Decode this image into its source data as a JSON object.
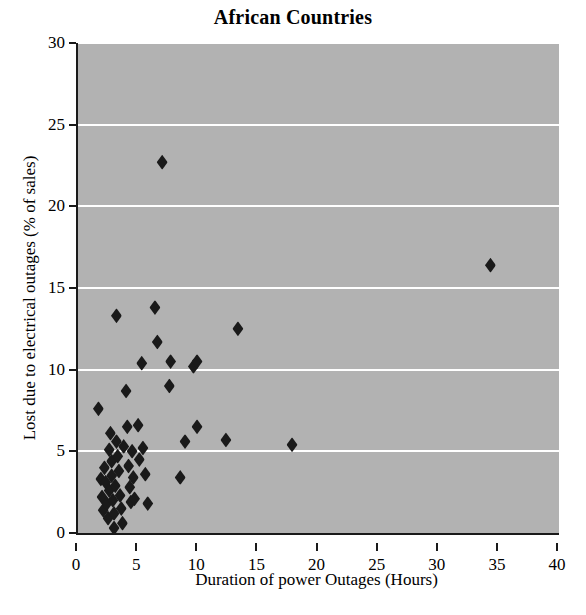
{
  "chart_data": {
    "type": "scatter",
    "title": "African Countries",
    "xlabel": "Duration of power Outages (Hours)",
    "ylabel": "Lost due to electrical outages (% of sales)",
    "xlim": [
      0,
      40
    ],
    "ylim": [
      0,
      30
    ],
    "xticks": [
      0,
      5,
      10,
      15,
      20,
      25,
      30,
      35,
      40
    ],
    "yticks": [
      0,
      5,
      10,
      15,
      20,
      25,
      30
    ],
    "xtick_labels": [
      "0",
      "5",
      "10",
      "15",
      "20",
      "25",
      "30",
      "35",
      "40"
    ],
    "ytick_labels": [
      "0",
      "5",
      "10",
      "15",
      "20",
      "25",
      "30"
    ],
    "grid": "horizontal",
    "gridline_color": "#ffffff",
    "plot_background": "#b2b2b2",
    "marker": "diamond",
    "marker_color": "#1a1a1a",
    "legend": null,
    "series": [
      {
        "name": "African Countries",
        "points": [
          [
            1.7,
            7.6
          ],
          [
            1.9,
            3.3
          ],
          [
            2.0,
            2.2
          ],
          [
            2.1,
            1.4
          ],
          [
            2.2,
            4.0
          ],
          [
            2.3,
            3.1
          ],
          [
            2.4,
            1.8
          ],
          [
            2.5,
            0.9
          ],
          [
            2.6,
            2.6
          ],
          [
            2.6,
            5.1
          ],
          [
            2.7,
            6.1
          ],
          [
            2.8,
            4.4
          ],
          [
            2.8,
            3.5
          ],
          [
            2.9,
            2.0
          ],
          [
            3.0,
            1.2
          ],
          [
            3.0,
            0.3
          ],
          [
            3.1,
            2.9
          ],
          [
            3.2,
            13.3
          ],
          [
            3.2,
            5.6
          ],
          [
            3.3,
            4.7
          ],
          [
            3.4,
            3.8
          ],
          [
            3.5,
            2.3
          ],
          [
            3.6,
            1.5
          ],
          [
            3.7,
            0.6
          ],
          [
            3.8,
            5.3
          ],
          [
            4.0,
            8.7
          ],
          [
            4.1,
            6.5
          ],
          [
            4.2,
            4.1
          ],
          [
            4.3,
            2.8
          ],
          [
            4.4,
            1.9
          ],
          [
            4.5,
            5.0
          ],
          [
            4.6,
            3.4
          ],
          [
            4.7,
            2.1
          ],
          [
            5.0,
            6.6
          ],
          [
            5.1,
            4.5
          ],
          [
            5.3,
            10.4
          ],
          [
            5.4,
            5.2
          ],
          [
            5.6,
            3.6
          ],
          [
            5.8,
            1.8
          ],
          [
            6.4,
            13.8
          ],
          [
            6.6,
            11.7
          ],
          [
            7.0,
            22.7
          ],
          [
            7.6,
            9.0
          ],
          [
            7.7,
            10.5
          ],
          [
            8.5,
            3.4
          ],
          [
            8.9,
            5.6
          ],
          [
            9.6,
            10.2
          ],
          [
            9.9,
            10.5
          ],
          [
            9.9,
            6.5
          ],
          [
            12.3,
            5.7
          ],
          [
            13.3,
            12.5
          ],
          [
            17.8,
            5.4
          ],
          [
            34.3,
            16.4
          ]
        ]
      }
    ]
  }
}
